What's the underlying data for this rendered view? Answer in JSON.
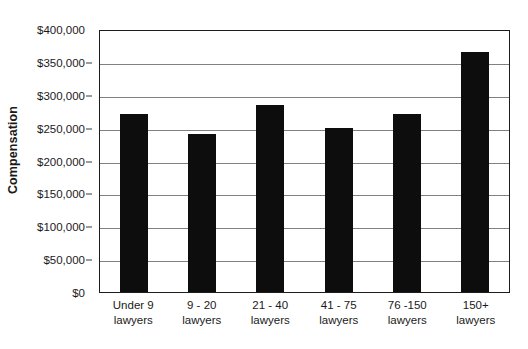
{
  "chart_data": {
    "type": "bar",
    "title": "",
    "xlabel": "",
    "ylabel": "Compensation",
    "ylim": [
      0,
      400000
    ],
    "ytick_step": 50000,
    "grid": true,
    "legend": false,
    "orientation": "vertical",
    "bar_color": "#0d0d0d",
    "categories": [
      "Under 9 lawyers",
      "9 - 20 lawyers",
      "21 - 40 lawyers",
      "41 - 75 lawyers",
      "76 -150 lawyers",
      "150+ lawyers"
    ],
    "category_lines": [
      {
        "line1": "Under 9",
        "line2": "lawyers"
      },
      {
        "line1": "9 - 20",
        "line2": "lawyers"
      },
      {
        "line1": "21 - 40",
        "line2": "lawyers"
      },
      {
        "line1": "41 - 75",
        "line2": "lawyers"
      },
      {
        "line1": "76 -150",
        "line2": "lawyers"
      },
      {
        "line1": "150+",
        "line2": "lawyers"
      }
    ],
    "values": [
      270000,
      240000,
      285000,
      250000,
      270000,
      365000
    ],
    "ytick_labels": [
      "$400,000",
      "$350,000",
      "$300,000",
      "$250,000",
      "$200,000",
      "$150,000",
      "$100,000",
      "$50,000",
      "$0"
    ],
    "ytick_values": [
      400000,
      350000,
      300000,
      250000,
      200000,
      150000,
      100000,
      50000,
      0
    ]
  }
}
